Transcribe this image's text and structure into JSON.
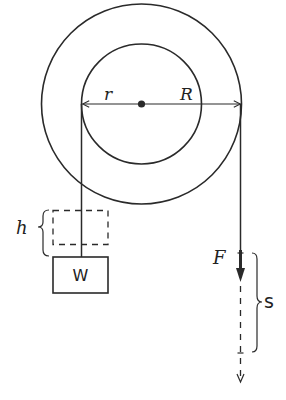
{
  "diagram": {
    "type": "pulley-wheel-and-axle",
    "labels": {
      "inner_radius": "r",
      "outer_radius": "R",
      "height": "h",
      "weight": "W",
      "force": "F",
      "distance": "s"
    },
    "geometry": {
      "center": [
        141.5,
        104
      ],
      "outer_radius_px": 100,
      "inner_radius_px": 60
    },
    "colors": {
      "stroke": "#2a2a2a",
      "background": "#ffffff"
    }
  }
}
